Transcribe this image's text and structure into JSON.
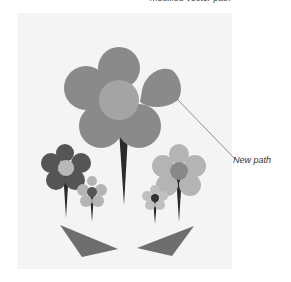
{
  "caption_top": "modified vector path",
  "callout_label": "New path",
  "colors": {
    "big_petal": "#8a8a8a",
    "big_center": "#a4a4a4",
    "dark_petal": "#555555",
    "dark_center": "#b8b8b8",
    "light_petal": "#b4b4b4",
    "light_center": "#888888",
    "tiny_center": "#333333",
    "stem": "#2a2a2a",
    "leaf": "#6e6e6e"
  }
}
